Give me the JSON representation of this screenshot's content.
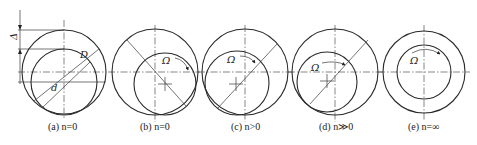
{
  "figure": {
    "panels": [
      {
        "id": "a",
        "caption": "(a) n=0",
        "labels": {
          "gap": "Δ",
          "outer_diameter": "D",
          "inner_diameter": "d"
        }
      },
      {
        "id": "b",
        "caption": "(b) n=0",
        "labels": {
          "rotation": "Ω"
        }
      },
      {
        "id": "c",
        "caption": "(c) n>0",
        "labels": {
          "rotation": "Ω"
        }
      },
      {
        "id": "d",
        "caption": "(d) n≫0",
        "labels": {
          "rotation": "Ω"
        }
      },
      {
        "id": "e",
        "caption": "(e) n=∞",
        "labels": {
          "rotation": "Ω"
        }
      }
    ]
  },
  "colors": {
    "line": "#2a2a2a",
    "background": "#ffffff"
  }
}
